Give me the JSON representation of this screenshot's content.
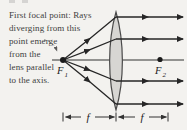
{
  "caption": {
    "lines": [
      "First focal point: Rays",
      "diverging from this",
      "point emerge",
      "from the",
      "lens parallel",
      "to the axis."
    ]
  },
  "labels": {
    "f1_base": "F",
    "f1_sub": "1",
    "f2_base": "F",
    "f2_sub": "2",
    "focal_left": "f",
    "focal_right": "f"
  },
  "colors": {
    "background": "#f3f2ef",
    "caption_text": "#3e3e3e",
    "ray": "#262626",
    "lens_fill": "#d7d6d3",
    "lens_stroke": "#4a4a4a",
    "leader": "#5a5a5a"
  }
}
